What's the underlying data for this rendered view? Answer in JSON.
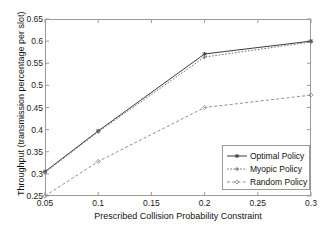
{
  "chart_data": {
    "type": "line",
    "title": "",
    "xlabel": "Prescribed Collision Probability Constraint",
    "ylabel": "Throughput (transmission percentage per slot)",
    "x": [
      0.05,
      0.1,
      0.2,
      0.3
    ],
    "xlim": [
      0.05,
      0.3
    ],
    "ylim": [
      0.25,
      0.65
    ],
    "xticks": [
      "0.05",
      "0.1",
      "0.15",
      "0.2",
      "0.25",
      "0.3"
    ],
    "xtick_values": [
      0.05,
      0.1,
      0.15,
      0.2,
      0.25,
      0.3
    ],
    "yticks": [
      "0.25",
      "0.3",
      "0.35",
      "0.4",
      "0.45",
      "0.5",
      "0.55",
      "0.6",
      "0.65"
    ],
    "ytick_values": [
      0.25,
      0.3,
      0.35,
      0.4,
      0.45,
      0.5,
      0.55,
      0.6,
      0.65
    ],
    "grid": false,
    "legend_position": "lower right",
    "series": [
      {
        "name": "Optimal Policy",
        "values": [
          0.305,
          0.397,
          0.571,
          0.6
        ],
        "linestyle": "solid",
        "marker": "asterisk",
        "color": "#3b3b3b"
      },
      {
        "name": "Myopic Policy",
        "values": [
          0.303,
          0.395,
          0.564,
          0.598
        ],
        "linestyle": "dotted",
        "marker": "plus",
        "color": "#6e6e6e"
      },
      {
        "name": "Random Policy",
        "values": [
          0.25,
          0.328,
          0.45,
          0.478
        ],
        "linestyle": "dashed",
        "marker": "diamond",
        "color": "#8f8f8f"
      }
    ]
  },
  "legend": {
    "items": [
      {
        "label": "Optimal Policy"
      },
      {
        "label": "Myopic Policy"
      },
      {
        "label": "Random Policy"
      }
    ]
  },
  "colors": {
    "axis": "#9a9a9a",
    "text": "#111111",
    "background": "#ffffff"
  }
}
